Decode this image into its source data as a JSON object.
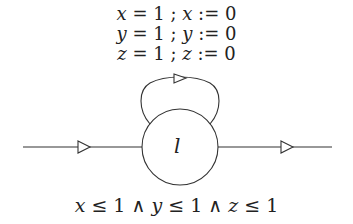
{
  "diagram": {
    "type": "timed-automaton",
    "self_loop_label": [
      {
        "var": "x",
        "guard": "= 1 ;",
        "reset_var": "x",
        "reset": ":= 0"
      },
      {
        "var": "y",
        "guard": "= 1 ;",
        "reset_var": "y",
        "reset": ":= 0"
      },
      {
        "var": "z",
        "guard": "= 1 ;",
        "reset_var": "z",
        "reset": ":= 0"
      }
    ],
    "location": {
      "label": "l"
    },
    "invariant": {
      "parts": [
        "x",
        " ≤ 1 ∧ ",
        "y",
        " ≤ 1 ∧ ",
        "z",
        " ≤ 1"
      ]
    },
    "edges": [
      {
        "name": "incoming-edge",
        "from": "left",
        "to": "l"
      },
      {
        "name": "self-loop",
        "from": "l",
        "to": "l"
      },
      {
        "name": "outgoing-edge",
        "from": "l",
        "to": "right"
      }
    ],
    "colors": {
      "stroke": "#333333",
      "text": "#222222",
      "background": "#ffffff"
    }
  }
}
